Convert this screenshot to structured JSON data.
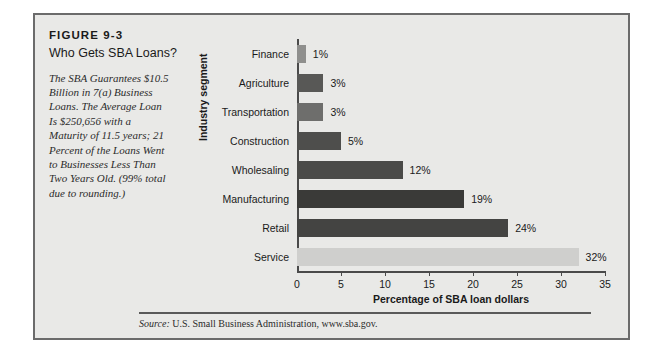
{
  "figure": {
    "number": "FIGURE 9-3",
    "title": "Who Gets SBA Loans?",
    "caption": "The SBA Guarantees $10.5 Billion in 7(a) Business Loans. The Average Loan Is $250,656 with a Maturity of 11.5 years; 21 Percent of the Loans Went to Businesses Less Than Two Years Old. (99% total due to rounding.)",
    "source_lead": "Source:",
    "source_body": "U.S. Small Business Administration, www.sba.gov.",
    "panel_bg": "#e9e9e7",
    "border_color": "#6b6b6b"
  },
  "chart_data": {
    "type": "bar",
    "orientation": "horizontal",
    "title": "Who Gets SBA Loans?",
    "xlabel": "Percentage of SBA loan dollars",
    "ylabel": "Industry segment",
    "xlim": [
      0,
      35
    ],
    "xticks": [
      0,
      5,
      10,
      15,
      20,
      25,
      30,
      35
    ],
    "grid": false,
    "legend": "none",
    "categories": [
      "Finance",
      "Agriculture",
      "Transportation",
      "Construction",
      "Wholesaling",
      "Manufacturing",
      "Retail",
      "Service"
    ],
    "values": [
      1,
      3,
      3,
      5,
      12,
      19,
      24,
      32
    ],
    "data_labels": [
      "1%",
      "3%",
      "3%",
      "5%",
      "12%",
      "19%",
      "24%",
      "32%"
    ],
    "bar_colors": [
      "#8f8f8d",
      "#585856",
      "#6e6e6c",
      "#4e4e4c",
      "#4a4a48",
      "#3a3a38",
      "#444442",
      "#cfcfcd"
    ]
  }
}
